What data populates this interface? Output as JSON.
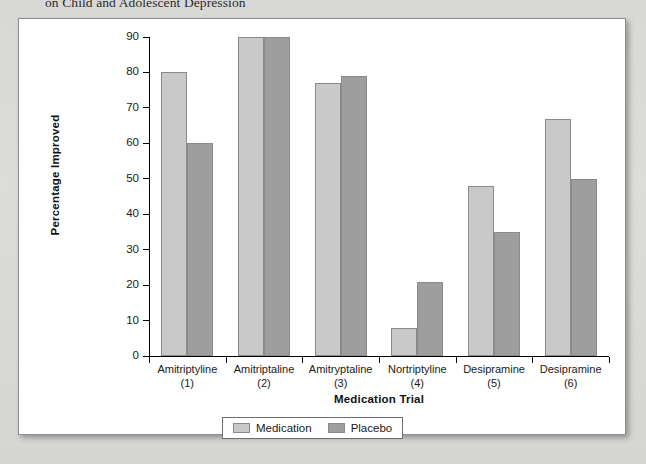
{
  "caption": {
    "clipped_line": "on Child and Adolescent Depression"
  },
  "chart_data": {
    "type": "bar",
    "title": "",
    "xlabel": "Medication Trial",
    "ylabel": "Percentage Improved",
    "ylim": [
      0,
      90
    ],
    "ytick_step": 10,
    "grid": false,
    "legend_position": "bottom-center",
    "categories": [
      "Amitriptyline",
      "Amitriptaline",
      "Amitryptaline",
      "Nortriptyline",
      "Desipramine",
      "Desipramine"
    ],
    "category_indices": [
      "(1)",
      "(2)",
      "(3)",
      "(4)",
      "(5)",
      "(6)"
    ],
    "yticks": [
      "0",
      "10",
      "20",
      "30",
      "40",
      "50",
      "60",
      "70",
      "80",
      "90"
    ],
    "series": [
      {
        "name": "Medication",
        "color": "#c9c9c9",
        "values": [
          80,
          90,
          77,
          8,
          48,
          67
        ]
      },
      {
        "name": "Placebo",
        "color": "#9e9e9e",
        "values": [
          60,
          90,
          79,
          21,
          35,
          50
        ]
      }
    ]
  }
}
